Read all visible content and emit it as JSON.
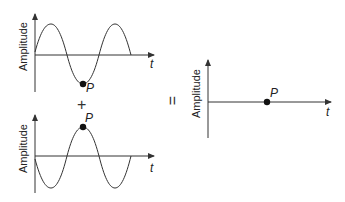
{
  "diagram": {
    "type": "wave-superposition",
    "graphs": [
      {
        "id": "wave-1",
        "y_label": "Amplitude",
        "x_label": "t",
        "point_label": "P",
        "point_position": "trough"
      },
      {
        "id": "wave-2",
        "y_label": "Amplitude",
        "x_label": "t",
        "point_label": "P",
        "point_position": "crest"
      },
      {
        "id": "result",
        "y_label": "Amplitude",
        "x_label": "t",
        "point_label": "P",
        "point_position": "zero"
      }
    ],
    "plus_sign": "+",
    "equals_sign": "="
  },
  "colors": {
    "line": "#333333",
    "point": "#111111",
    "background": "#ffffff"
  }
}
